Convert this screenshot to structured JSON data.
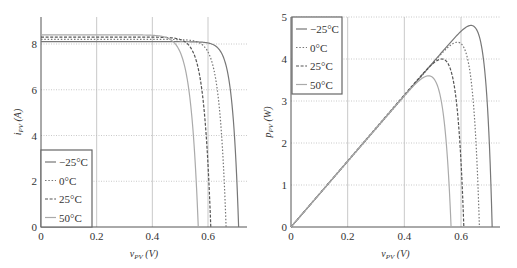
{
  "chart_data": [
    {
      "type": "line",
      "title": "",
      "xlabel": "v_PV (V)",
      "ylabel": "i_PV (A)",
      "xlim": [
        0,
        0.73
      ],
      "ylim": [
        0,
        9.2
      ],
      "xticks": [
        "0",
        "0.2",
        "0.4",
        "0.6"
      ],
      "yticks": [
        "0",
        "2",
        "4",
        "6",
        "8"
      ],
      "grid": true,
      "legend_position": "lower left",
      "series": [
        {
          "name": "−25°C",
          "style": "solid",
          "isc": 8.1,
          "voc": 0.71,
          "points": [
            [
              0,
              8.1
            ],
            [
              0.5,
              8.07
            ],
            [
              0.58,
              7.95
            ],
            [
              0.62,
              7.6
            ],
            [
              0.65,
              6.8
            ],
            [
              0.67,
              5.6
            ],
            [
              0.69,
              3.6
            ],
            [
              0.7,
              2.0
            ],
            [
              0.71,
              0
            ]
          ]
        },
        {
          "name": "0°C",
          "style": "dotted",
          "isc": 8.2,
          "voc": 0.665,
          "points": [
            [
              0,
              8.2
            ],
            [
              0.45,
              8.15
            ],
            [
              0.52,
              8.0
            ],
            [
              0.57,
              7.5
            ],
            [
              0.6,
              6.6
            ],
            [
              0.62,
              5.6
            ],
            [
              0.64,
              4.0
            ],
            [
              0.655,
              2.2
            ],
            [
              0.665,
              0
            ]
          ]
        },
        {
          "name": "25°C",
          "style": "dashed",
          "isc": 8.3,
          "voc": 0.61,
          "points": [
            [
              0,
              8.3
            ],
            [
              0.4,
              8.25
            ],
            [
              0.47,
              8.05
            ],
            [
              0.52,
              7.4
            ],
            [
              0.55,
              6.4
            ],
            [
              0.57,
              5.3
            ],
            [
              0.59,
              3.6
            ],
            [
              0.6,
              2.0
            ],
            [
              0.61,
              0
            ]
          ]
        },
        {
          "name": "50°C",
          "style": "solid-light",
          "isc": 8.4,
          "voc": 0.565,
          "points": [
            [
              0,
              8.4
            ],
            [
              0.36,
              8.35
            ],
            [
              0.42,
              8.1
            ],
            [
              0.47,
              7.3
            ],
            [
              0.5,
              6.3
            ],
            [
              0.52,
              5.2
            ],
            [
              0.54,
              3.6
            ],
            [
              0.555,
              1.8
            ],
            [
              0.565,
              0
            ]
          ]
        }
      ]
    },
    {
      "type": "line",
      "title": "",
      "xlabel": "v_PV (V)",
      "ylabel": "p_PV (W)",
      "xlim": [
        0,
        0.73
      ],
      "ylim": [
        0,
        5
      ],
      "xticks": [
        "0",
        "0.2",
        "0.4",
        "0.6"
      ],
      "yticks": [
        "0",
        "1",
        "2",
        "3",
        "4",
        "5"
      ],
      "grid": true,
      "legend_position": "upper left",
      "series": [
        {
          "name": "−25°C",
          "style": "solid",
          "pmax": 4.8,
          "vmp": 0.615,
          "voc": 0.71
        },
        {
          "name": "0°C",
          "style": "dotted",
          "pmax": 4.4,
          "vmp": 0.565,
          "voc": 0.665
        },
        {
          "name": "25°C",
          "style": "dashed",
          "pmax": 4.0,
          "vmp": 0.51,
          "voc": 0.61
        },
        {
          "name": "50°C",
          "style": "solid-light",
          "pmax": 3.6,
          "vmp": 0.455,
          "voc": 0.565
        }
      ]
    }
  ],
  "left": {
    "ylabel_main": "i",
    "ylabel_sub": "PV",
    "ylabel_unit": "(A)",
    "xlabel_main": "v",
    "xlabel_sub": "PV",
    "xlabel_unit": "(V)"
  },
  "right": {
    "ylabel_main": "p",
    "ylabel_sub": "PV",
    "ylabel_unit": "(W)",
    "xlabel_main": "v",
    "xlabel_sub": "PV",
    "xlabel_unit": "(V)"
  },
  "legend": [
    "−25°C",
    "0°C",
    "25°C",
    "50°C"
  ],
  "colors": {
    "axis": "#555555",
    "grid": "#bbbbbb",
    "curve_dark": "#777777",
    "curve_light": "#aaaaaa"
  }
}
